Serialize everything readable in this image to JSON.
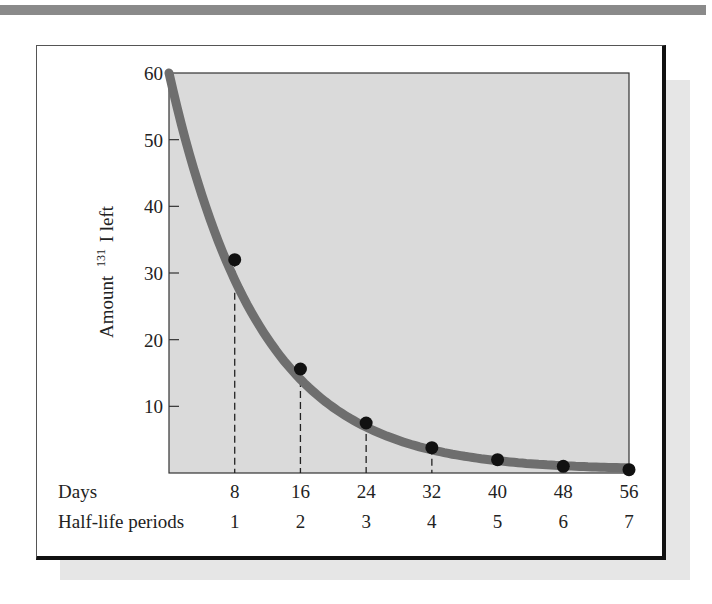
{
  "chart_data": {
    "type": "line",
    "title": "",
    "xlabel": "Days",
    "x2label": "Half-life periods",
    "ylabel": "Amount ¹³¹I left",
    "ylabel_main": "Amount",
    "ylabel_sup": "131",
    "ylabel_tail": "I left",
    "ylim": [
      0,
      60
    ],
    "xlim": [
      0,
      56
    ],
    "yticks": [
      10,
      20,
      30,
      40,
      50,
      60
    ],
    "xticks": [
      8,
      16,
      24,
      32,
      40,
      48,
      56
    ],
    "x2ticks": [
      1,
      2,
      3,
      4,
      5,
      6,
      7
    ],
    "grid": false,
    "curve": {
      "start": [
        0,
        60
      ],
      "shape": "exponential decay, half-life 8 days"
    },
    "points": [
      {
        "day": 8,
        "half_life": 1,
        "amount": 32
      },
      {
        "day": 16,
        "half_life": 2,
        "amount": 15.6
      },
      {
        "day": 24,
        "half_life": 3,
        "amount": 7.5
      },
      {
        "day": 32,
        "half_life": 4,
        "amount": 3.8
      },
      {
        "day": 40,
        "half_life": 5,
        "amount": 2
      },
      {
        "day": 48,
        "half_life": 6,
        "amount": 1
      },
      {
        "day": 56,
        "half_life": 7,
        "amount": 0.5
      }
    ],
    "dashed_drop_lines": [
      8,
      16,
      24,
      32
    ],
    "colors": {
      "plot_bg": "#d9d9d9",
      "curve": "#6e6e6e",
      "points": "#111111"
    }
  },
  "labels": {
    "days": "Days",
    "half_life": "Half-life periods",
    "y_main": "Amount",
    "y_sup": "131",
    "y_tail": "I left"
  },
  "yticks": [
    "10",
    "20",
    "30",
    "40",
    "50",
    "60"
  ],
  "xticks": [
    "8",
    "16",
    "24",
    "32",
    "40",
    "48",
    "56"
  ],
  "x2ticks": [
    "1",
    "2",
    "3",
    "4",
    "5",
    "6",
    "7"
  ]
}
